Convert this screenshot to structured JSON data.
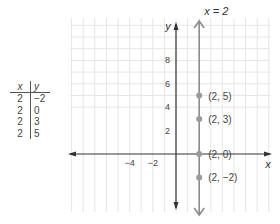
{
  "table": {
    "headers": [
      "x",
      "y"
    ],
    "rows": [
      [
        "2",
        "−2"
      ],
      [
        "2",
        "0"
      ],
      [
        "2",
        "3"
      ],
      [
        "2",
        "5"
      ]
    ]
  },
  "chart_data": {
    "type": "scatter",
    "title": "",
    "xlabel": "x",
    "ylabel": "y",
    "xlim": [
      -9,
      8
    ],
    "ylim": [
      -5,
      11
    ],
    "grid": true,
    "x_ticks": [
      {
        "value": -4,
        "label": "−4"
      },
      {
        "value": -2,
        "label": "−2"
      }
    ],
    "y_ticks": [
      {
        "value": 2,
        "label": "2"
      },
      {
        "value": 4,
        "label": "4"
      },
      {
        "value": 6,
        "label": "6"
      },
      {
        "value": 8,
        "label": "8"
      }
    ],
    "vertical_line": {
      "x": 2,
      "label": "x = 2"
    },
    "points": [
      {
        "x": 2,
        "y": 5,
        "label": "(2, 5)"
      },
      {
        "x": 2,
        "y": 3,
        "label": "(2, 3)"
      },
      {
        "x": 2,
        "y": 0,
        "label": "(2, 0)"
      },
      {
        "x": 2,
        "y": -2,
        "label": "(2, −2)"
      }
    ],
    "colors": {
      "axis": "#333333",
      "line": "#8c8c8c",
      "point": "#9a9a9a",
      "grid": "#e6e6e6"
    }
  }
}
